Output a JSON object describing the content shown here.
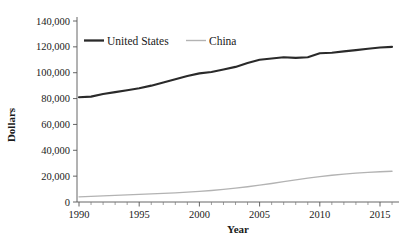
{
  "chart_data": {
    "type": "line",
    "title": "",
    "xlabel": "Year",
    "ylabel": "Dollars",
    "xlim": [
      1989.4,
      2016.6
    ],
    "ylim": [
      0,
      140000
    ],
    "grid": false,
    "legend_position": "top-left-inside",
    "y_ticks": [
      0,
      20000,
      40000,
      60000,
      80000,
      100000,
      120000,
      140000
    ],
    "y_tick_labels": [
      "0",
      "20,000",
      "40,000",
      "60,000",
      "80,000",
      "100,000",
      "120,000",
      "140,000"
    ],
    "x_ticks": [
      1990,
      1995,
      2000,
      2005,
      2010,
      2015
    ],
    "x_tick_labels": [
      "1990",
      "1995",
      "2000",
      "2005",
      "2010",
      "2015"
    ],
    "x_minor_tick_step": 1,
    "x": [
      1990,
      1991,
      1992,
      1993,
      1994,
      1995,
      1996,
      1997,
      1998,
      1999,
      2000,
      2001,
      2002,
      2003,
      2004,
      2005,
      2006,
      2007,
      2008,
      2009,
      2010,
      2011,
      2012,
      2013,
      2014,
      2015,
      2016
    ],
    "series": [
      {
        "name": "United States",
        "color": "#2a2a2a",
        "width": "thick",
        "values": [
          81000,
          81500,
          83500,
          85000,
          86500,
          88000,
          90000,
          92500,
          95000,
          97500,
          99500,
          100500,
          102500,
          104500,
          107500,
          110000,
          111000,
          112000,
          111500,
          112000,
          115000,
          115500,
          116500,
          117500,
          118500,
          119500,
          120000
        ]
      },
      {
        "name": "China",
        "color": "#b3b3b3",
        "width": "thin",
        "values": [
          4000,
          4300,
          4700,
          5100,
          5500,
          5900,
          6300,
          6700,
          7100,
          7600,
          8200,
          8900,
          9700,
          10700,
          11800,
          13000,
          14300,
          15700,
          17100,
          18400,
          19600,
          20700,
          21600,
          22300,
          22900,
          23400,
          23800
        ]
      }
    ]
  },
  "legend": {
    "entries": [
      {
        "label": "United States"
      },
      {
        "label": "China"
      }
    ]
  }
}
